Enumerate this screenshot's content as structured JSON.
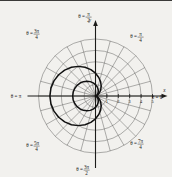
{
  "figure": {
    "title": "",
    "axis_x_label": "x",
    "axis_y_label": "y"
  },
  "chart_data": {
    "type": "line",
    "coordinate_system": "polar",
    "title": "",
    "xlabel": "x",
    "ylabel": "y",
    "grid": true,
    "legend_position": "none",
    "r_ticks": [
      1,
      2,
      3,
      4,
      5
    ],
    "r_tick_labels": [
      "1",
      "2",
      "3",
      "4",
      "5"
    ],
    "rlim": [
      0,
      5
    ],
    "theta_spoke_step_deg": 15,
    "theta_labels": [
      {
        "id": "theta-0",
        "text": "θ = 0",
        "angle_deg": 0,
        "prefix": "θ =",
        "value": "0",
        "fraction": false
      },
      {
        "id": "theta-pi-4",
        "text": "θ = π/4",
        "angle_deg": 45,
        "prefix": "θ =",
        "numerator": "π",
        "denominator": "4",
        "fraction": true
      },
      {
        "id": "theta-pi-2",
        "text": "θ = π/2",
        "angle_deg": 90,
        "prefix": "θ =",
        "numerator": "π",
        "denominator": "2",
        "fraction": true
      },
      {
        "id": "theta-3pi-4",
        "text": "θ = 3π/4",
        "angle_deg": 135,
        "prefix": "θ =",
        "numerator": "3π",
        "denominator": "4",
        "fraction": true
      },
      {
        "id": "theta-pi",
        "text": "θ = π",
        "angle_deg": 180,
        "prefix": "θ =",
        "value": "π",
        "fraction": false
      },
      {
        "id": "theta-5pi-4",
        "text": "θ = 5π/4",
        "angle_deg": 225,
        "prefix": "θ =",
        "numerator": "5π",
        "denominator": "4",
        "fraction": true
      },
      {
        "id": "theta-3pi-2",
        "text": "θ = 3π/2",
        "angle_deg": 270,
        "prefix": "θ =",
        "numerator": "3π",
        "denominator": "2",
        "fraction": true
      },
      {
        "id": "theta-7pi-4",
        "text": "θ = 7π/4",
        "angle_deg": 315,
        "prefix": "θ =",
        "numerator": "7π",
        "denominator": "4",
        "fraction": true
      }
    ],
    "series": [
      {
        "name": "outer-limacon",
        "equation": "r = 2(1 - cos θ)",
        "color": "#111111",
        "r_max": 4,
        "theta_deg": [
          0,
          10,
          20,
          30,
          40,
          50,
          60,
          70,
          80,
          90,
          100,
          110,
          120,
          130,
          140,
          150,
          160,
          170,
          180,
          190,
          200,
          210,
          220,
          230,
          240,
          250,
          260,
          270,
          280,
          290,
          300,
          310,
          320,
          330,
          340,
          350,
          360
        ],
        "r": [
          0,
          0.03,
          0.121,
          0.268,
          0.468,
          0.714,
          1.0,
          1.316,
          1.653,
          2.0,
          2.347,
          2.684,
          3.0,
          3.286,
          3.532,
          3.732,
          3.879,
          3.97,
          4.0,
          3.97,
          3.879,
          3.732,
          3.532,
          3.286,
          3.0,
          2.684,
          2.347,
          2.0,
          1.653,
          1.316,
          1.0,
          0.714,
          0.468,
          0.268,
          0.121,
          0.03,
          0
        ]
      },
      {
        "name": "inner-limacon",
        "equation": "r = 1(1 - cos θ)",
        "color": "#111111",
        "r_max": 2,
        "theta_deg": [
          0,
          10,
          20,
          30,
          40,
          50,
          60,
          70,
          80,
          90,
          100,
          110,
          120,
          130,
          140,
          150,
          160,
          170,
          180,
          190,
          200,
          210,
          220,
          230,
          240,
          250,
          260,
          270,
          280,
          290,
          300,
          310,
          320,
          330,
          340,
          350,
          360
        ],
        "r": [
          0,
          0.015,
          0.06,
          0.134,
          0.234,
          0.357,
          0.5,
          0.658,
          0.826,
          1.0,
          1.174,
          1.342,
          1.5,
          1.643,
          1.766,
          1.866,
          1.94,
          1.985,
          2.0,
          1.985,
          1.94,
          1.866,
          1.766,
          1.643,
          1.5,
          1.342,
          1.174,
          1.0,
          0.826,
          0.658,
          0.5,
          0.357,
          0.234,
          0.134,
          0.06,
          0.015,
          0
        ]
      }
    ]
  }
}
